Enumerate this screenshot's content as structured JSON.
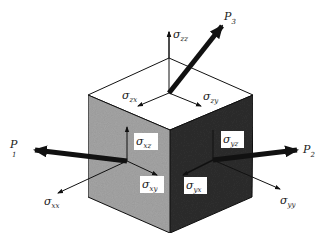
{
  "diagram": {
    "colors": {
      "top_face": "#ffffff",
      "left_face": "#a6a6a6",
      "right_face": "#2e2e2e",
      "edge": "#111111",
      "arrow": "#111111",
      "label_box": "#ffffff"
    },
    "labels": {
      "szz": {
        "sigma": "σ",
        "sub": "zz"
      },
      "szx": {
        "sigma": "σ",
        "sub": "zx"
      },
      "szy": {
        "sigma": "σ",
        "sub": "zy"
      },
      "sxz": {
        "sigma": "σ",
        "sub": "xz"
      },
      "sxy": {
        "sigma": "σ",
        "sub": "xy"
      },
      "sxx": {
        "sigma": "σ",
        "sub": "xx"
      },
      "syz": {
        "sigma": "σ",
        "sub": "yz"
      },
      "syx": {
        "sigma": "σ",
        "sub": "yx"
      },
      "syy": {
        "sigma": "σ",
        "sub": "yy"
      },
      "p1": {
        "base": "P",
        "sub": "1"
      },
      "p2": {
        "base": "P",
        "sub": "2"
      },
      "p3": {
        "base": "P",
        "sub": "3"
      }
    }
  }
}
